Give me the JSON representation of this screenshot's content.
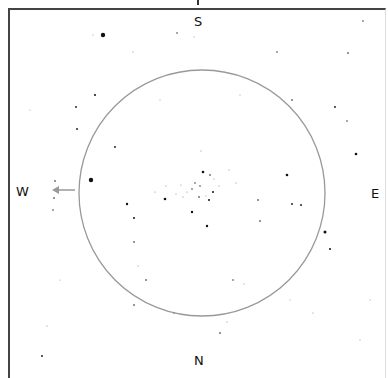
{
  "chart_data": {
    "type": "scatter",
    "title": "",
    "directions": {
      "top": "S",
      "bottom": "N",
      "left": "W",
      "right": "E"
    },
    "fov_circle": {
      "cx": 202,
      "cy": 193,
      "r": 123,
      "color": "#999999"
    },
    "arrow": {
      "from": [
        75,
        190
      ],
      "to": [
        52,
        190
      ],
      "color": "#999999",
      "direction": "W"
    },
    "stars": [
      {
        "x": 103,
        "y": 35,
        "r": 2.2
      },
      {
        "x": 93,
        "y": 35,
        "r": 0.6
      },
      {
        "x": 177,
        "y": 33,
        "r": 0.7
      },
      {
        "x": 194,
        "y": 37,
        "r": 0.5
      },
      {
        "x": 133,
        "y": 52,
        "r": 0.6
      },
      {
        "x": 277,
        "y": 52,
        "r": 0.7
      },
      {
        "x": 363,
        "y": 21,
        "r": 0.7
      },
      {
        "x": 95,
        "y": 95,
        "r": 1.0
      },
      {
        "x": 76,
        "y": 107,
        "r": 0.9
      },
      {
        "x": 77,
        "y": 129,
        "r": 0.9
      },
      {
        "x": 292,
        "y": 100,
        "r": 0.8
      },
      {
        "x": 335,
        "y": 107,
        "r": 0.9
      },
      {
        "x": 348,
        "y": 53,
        "r": 0.8
      },
      {
        "x": 356,
        "y": 154,
        "r": 1.3
      },
      {
        "x": 347,
        "y": 121,
        "r": 0.7
      },
      {
        "x": 115,
        "y": 147,
        "r": 0.9
      },
      {
        "x": 201,
        "y": 151,
        "r": 0.6
      },
      {
        "x": 91,
        "y": 180,
        "r": 2.2
      },
      {
        "x": 55,
        "y": 181,
        "r": 0.8
      },
      {
        "x": 54,
        "y": 198,
        "r": 0.8
      },
      {
        "x": 53,
        "y": 210,
        "r": 0.7
      },
      {
        "x": 127,
        "y": 204,
        "r": 1.2
      },
      {
        "x": 134,
        "y": 218,
        "r": 1.0
      },
      {
        "x": 165,
        "y": 199,
        "r": 1.3
      },
      {
        "x": 192,
        "y": 212,
        "r": 1.2
      },
      {
        "x": 207,
        "y": 226,
        "r": 1.2
      },
      {
        "x": 203,
        "y": 172,
        "r": 1.3
      },
      {
        "x": 210,
        "y": 175,
        "r": 0.8
      },
      {
        "x": 213,
        "y": 192,
        "r": 1.0
      },
      {
        "x": 209,
        "y": 200,
        "r": 1.0
      },
      {
        "x": 199,
        "y": 197,
        "r": 0.8
      },
      {
        "x": 195,
        "y": 183,
        "r": 0.7
      },
      {
        "x": 192,
        "y": 189,
        "r": 0.7
      },
      {
        "x": 200,
        "y": 186,
        "r": 0.7
      },
      {
        "x": 187,
        "y": 192,
        "r": 0.6
      },
      {
        "x": 181,
        "y": 185,
        "r": 0.6
      },
      {
        "x": 176,
        "y": 194,
        "r": 0.6
      },
      {
        "x": 183,
        "y": 197,
        "r": 0.6
      },
      {
        "x": 214,
        "y": 179,
        "r": 0.6
      },
      {
        "x": 219,
        "y": 186,
        "r": 0.6
      },
      {
        "x": 206,
        "y": 196,
        "r": 0.6
      },
      {
        "x": 155,
        "y": 192,
        "r": 0.6
      },
      {
        "x": 166,
        "y": 186,
        "r": 0.6
      },
      {
        "x": 229,
        "y": 170,
        "r": 0.6
      },
      {
        "x": 236,
        "y": 183,
        "r": 0.6
      },
      {
        "x": 287,
        "y": 175,
        "r": 1.3
      },
      {
        "x": 292,
        "y": 204,
        "r": 0.9
      },
      {
        "x": 301,
        "y": 205,
        "r": 0.9
      },
      {
        "x": 325,
        "y": 232,
        "r": 1.5
      },
      {
        "x": 330,
        "y": 249,
        "r": 1.0
      },
      {
        "x": 258,
        "y": 200,
        "r": 0.8
      },
      {
        "x": 260,
        "y": 221,
        "r": 0.8
      },
      {
        "x": 134,
        "y": 242,
        "r": 0.8
      },
      {
        "x": 138,
        "y": 266,
        "r": 0.6
      },
      {
        "x": 146,
        "y": 280,
        "r": 0.8
      },
      {
        "x": 233,
        "y": 280,
        "r": 0.7
      },
      {
        "x": 244,
        "y": 284,
        "r": 0.6
      },
      {
        "x": 174,
        "y": 313,
        "r": 0.7
      },
      {
        "x": 134,
        "y": 305,
        "r": 0.8
      },
      {
        "x": 220,
        "y": 333,
        "r": 0.8
      },
      {
        "x": 227,
        "y": 322,
        "r": 0.6
      },
      {
        "x": 313,
        "y": 313,
        "r": 0.6
      },
      {
        "x": 47,
        "y": 326,
        "r": 0.6
      },
      {
        "x": 42,
        "y": 356,
        "r": 0.9
      },
      {
        "x": 360,
        "y": 340,
        "r": 0.6
      },
      {
        "x": 370,
        "y": 300,
        "r": 0.6
      },
      {
        "x": 60,
        "y": 280,
        "r": 0.5
      },
      {
        "x": 30,
        "y": 110,
        "r": 0.5
      },
      {
        "x": 240,
        "y": 95,
        "r": 0.5
      },
      {
        "x": 160,
        "y": 100,
        "r": 0.5
      },
      {
        "x": 290,
        "y": 300,
        "r": 0.5
      }
    ]
  },
  "labels": {
    "south": "S",
    "north": "N",
    "west": "W",
    "east": "E"
  }
}
